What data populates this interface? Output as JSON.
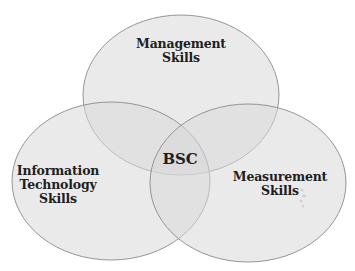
{
  "diagram": {
    "type": "venn",
    "sets": [
      {
        "id": "management",
        "lines": [
          "Management",
          "Skills"
        ]
      },
      {
        "id": "it",
        "lines": [
          "Information",
          "Technology",
          "Skills"
        ]
      },
      {
        "id": "measurement",
        "lines": [
          "Measurement",
          "Skills"
        ]
      }
    ],
    "intersection": {
      "label": "BSC"
    },
    "colors": {
      "fill": "#dcdcdc",
      "stroke": "#8a8a8a",
      "text": "#1e1e1e"
    }
  }
}
